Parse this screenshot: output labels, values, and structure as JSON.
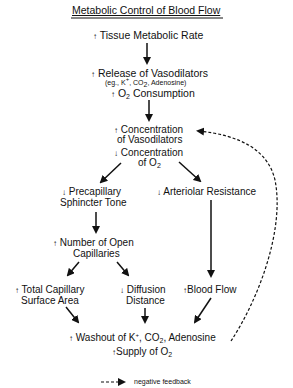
{
  "diagram": {
    "title": "Metabolic Control of Blood Flow",
    "nodes": {
      "tissue_rate": {
        "dir": "↑",
        "text": "Tissue Metabolic Rate"
      },
      "release": {
        "dir": "↑",
        "text": "Release of Vasodilators"
      },
      "release_examples": {
        "pre": "(eg., K",
        "sup": "+",
        "mid": ", CO",
        "sub": "2",
        "post": ", Adenosine)"
      },
      "o2_consumption": {
        "dir": "↑",
        "pre": "O",
        "sub": "2",
        "post": " Consumption"
      },
      "conc_vaso_1": {
        "dir": "↑",
        "text": "Concentration"
      },
      "conc_vaso_2": {
        "text": "of Vasodilators"
      },
      "conc_o2_1": {
        "dir": "↓",
        "text": "Concentration"
      },
      "conc_o2_2": {
        "pre": "of O",
        "sub": "2"
      },
      "precap_1": {
        "dir": "↓",
        "text": "Precapillary"
      },
      "precap_2": {
        "text": "Sphincter Tone"
      },
      "arteriolar": {
        "dir": "↓",
        "text": "Arteriolar Resistance"
      },
      "open_cap_1": {
        "dir": "↑",
        "text": "Number of Open"
      },
      "open_cap_2": {
        "text": "Capillaries"
      },
      "surface_1": {
        "dir": "↑",
        "text": "Total Capillary"
      },
      "surface_2": {
        "text": "Surface Area"
      },
      "diffusion_1": {
        "dir": "↓",
        "text": "Diffusion"
      },
      "diffusion_2": {
        "text": "Distance"
      },
      "blood_flow": {
        "dir": "↑",
        "text": "Blood Flow"
      },
      "washout": {
        "dir": "↑",
        "pre": "Washout of K",
        "sup": "+",
        "mid": ", CO",
        "sub": "2",
        "post": ", Adenosine"
      },
      "supply": {
        "dir": "↑",
        "pre": "Supply of O",
        "sub": "2"
      }
    },
    "legend": {
      "label": "negative feedback"
    }
  }
}
